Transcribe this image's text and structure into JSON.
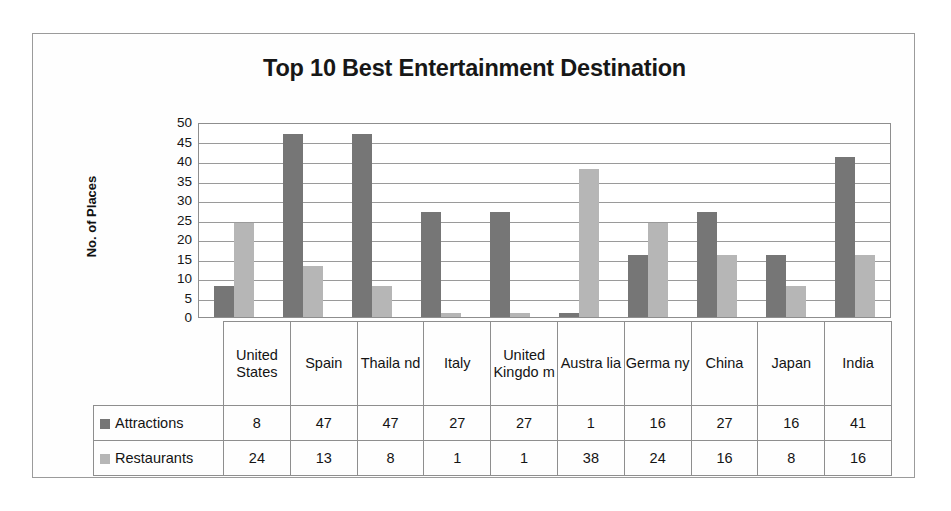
{
  "chart_data": {
    "type": "bar",
    "title": "Top 10 Best Entertainment Destination",
    "xlabel": "",
    "ylabel": "No. of Places",
    "ylim": [
      0,
      50
    ],
    "ytick_step": 5,
    "yticks": [
      "50",
      "45",
      "40",
      "35",
      "30",
      "25",
      "20",
      "15",
      "10",
      "5",
      "0"
    ],
    "grid": true,
    "legend_position": "data-table-row-labels",
    "categories": [
      "United States",
      "Spain",
      "Thailand",
      "Italy",
      "United Kingdom",
      "Australia",
      "Germany",
      "China",
      "Japan",
      "India"
    ],
    "category_display": [
      "United States",
      "Spain",
      "Thaila nd",
      "Italy",
      "United Kingdo m",
      "Austra lia",
      "Germa ny",
      "China",
      "Japan",
      "India"
    ],
    "series": [
      {
        "name": "Attractions",
        "color": "#767676",
        "values": [
          8,
          47,
          47,
          27,
          27,
          1,
          16,
          27,
          16,
          41
        ]
      },
      {
        "name": "Restaurants",
        "color": "#b6b6b6",
        "values": [
          24,
          13,
          8,
          1,
          1,
          38,
          24,
          16,
          8,
          16
        ]
      }
    ]
  },
  "colors": {
    "attractions": "#767676",
    "restaurants": "#b6b6b6",
    "gridline": "#9a9a9a",
    "border": "#8e8e8e",
    "frame": "#9b9b9b",
    "text": "#141414"
  }
}
